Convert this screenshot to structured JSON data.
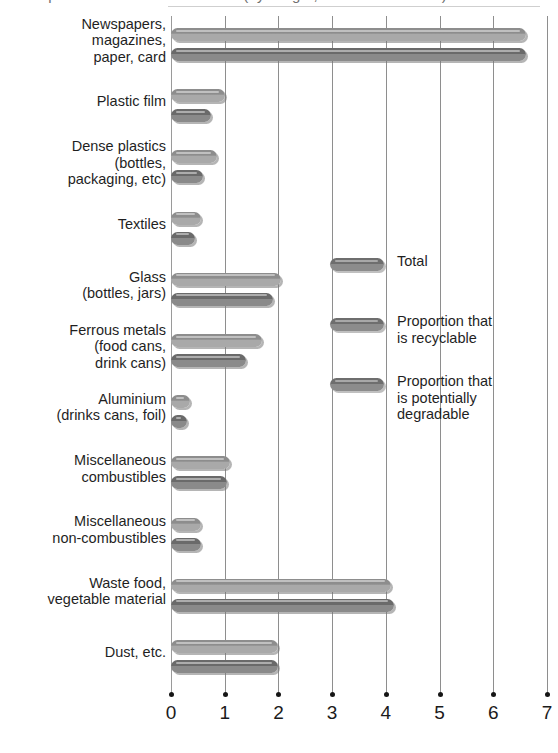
{
  "chart_data": {
    "type": "bar",
    "orientation": "horizontal",
    "title": "Composition of household waste (by weight, millions of tonnes)",
    "title_clipped": true,
    "xlabel": "",
    "ylabel": "",
    "xlim": [
      0,
      7
    ],
    "xticks": [
      0,
      1,
      2,
      3,
      4,
      5,
      6,
      7
    ],
    "xtick_labels": [
      "0",
      "1",
      "2",
      "3",
      "4",
      "5",
      "6",
      "7"
    ],
    "grid": true,
    "grid_axis": "x",
    "legend_position": "center-right",
    "categories": [
      "Newspapers,\nmagazines,\npaper, card",
      "Plastic film",
      "Dense plastics\n(bottles,\npackaging, etc)",
      "Textiles",
      "Glass\n(bottles, jars)",
      "Ferrous metals\n(food cans,\ndrink cans)",
      "Aluminium\n(drinks cans, foil)",
      "Miscellaneous\ncombustibles",
      "Miscellaneous\nnon-combustibles",
      "Waste food,\nvegetable material",
      "Dust, etc."
    ],
    "series": [
      {
        "name": "Total",
        "values": [
          6.6,
          1.0,
          0.85,
          0.55,
          2.05,
          1.7,
          0.35,
          1.1,
          0.55,
          4.1,
          2.0
        ]
      },
      {
        "name": "Proportion that is recyclable / potentially degradable",
        "values": [
          6.6,
          0.75,
          0.6,
          0.45,
          1.9,
          1.4,
          0.3,
          1.05,
          0.55,
          4.15,
          2.0
        ]
      }
    ],
    "colors": {
      "total_bar": "#8d8d8d",
      "sub_bar": "#6a6a6a",
      "gridline": "#8e8e8e",
      "text": "#1f1f1f",
      "tick_dot": "#151515"
    }
  },
  "legend": {
    "items": [
      {
        "label": "Total"
      },
      {
        "label": "Proportion that\nis recyclable"
      },
      {
        "label": "Proportion that\nis potentially\ndegradable"
      }
    ]
  }
}
